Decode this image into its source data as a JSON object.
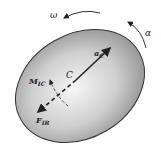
{
  "diagram": {
    "body": "rigid-ellipse",
    "labels": {
      "omega": "ω",
      "alpha": "α",
      "acceleration": "a",
      "acceleration_sub": "C",
      "center": "C",
      "moment": "M",
      "moment_sub": "IC",
      "force": "F",
      "force_sub": "IR"
    },
    "colors": {
      "shade_light": "#f4f4f4",
      "shade_dark": "#8a8a8a",
      "outline": "#333333",
      "arrows": "#222222"
    }
  }
}
